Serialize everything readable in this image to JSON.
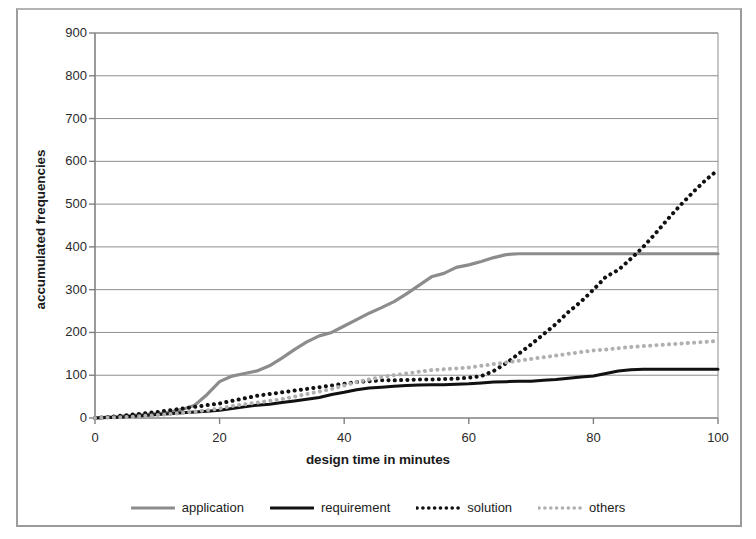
{
  "chart_data": {
    "type": "line",
    "title": "",
    "xlabel": "design time in minutes",
    "ylabel": "accumulated frequencies",
    "xlim": [
      0,
      100
    ],
    "ylim": [
      0,
      900
    ],
    "xticks": [
      0,
      20,
      40,
      60,
      80,
      100
    ],
    "yticks": [
      0,
      100,
      200,
      300,
      400,
      500,
      600,
      700,
      800,
      900
    ],
    "grid": "horizontal",
    "legend_position": "bottom",
    "x": [
      0,
      2,
      4,
      6,
      8,
      10,
      12,
      14,
      16,
      18,
      20,
      22,
      24,
      26,
      28,
      30,
      32,
      34,
      36,
      38,
      40,
      42,
      44,
      46,
      48,
      50,
      52,
      54,
      56,
      58,
      60,
      62,
      64,
      66,
      68,
      70,
      72,
      74,
      76,
      78,
      80,
      82,
      84,
      86,
      88,
      90,
      92,
      94,
      96,
      98,
      100
    ],
    "series": [
      {
        "name": "application",
        "style": "solid",
        "color": "#8c8c8c",
        "width": 3.2,
        "values": [
          0,
          2,
          4,
          6,
          8,
          10,
          14,
          20,
          30,
          55,
          85,
          98,
          104,
          110,
          122,
          140,
          160,
          178,
          192,
          200,
          215,
          230,
          245,
          258,
          272,
          290,
          310,
          330,
          338,
          352,
          358,
          366,
          375,
          382,
          384,
          384,
          384,
          384,
          384,
          384,
          384,
          384,
          384,
          384,
          384,
          384,
          384,
          384,
          384,
          384,
          384
        ]
      },
      {
        "name": "requirement",
        "style": "solid",
        "color": "#111111",
        "width": 3.0,
        "values": [
          0,
          1,
          2,
          4,
          6,
          8,
          10,
          12,
          14,
          16,
          18,
          22,
          26,
          30,
          32,
          36,
          40,
          44,
          48,
          55,
          60,
          66,
          70,
          72,
          74,
          76,
          77,
          78,
          78,
          79,
          80,
          82,
          84,
          85,
          86,
          86,
          88,
          90,
          93,
          96,
          98,
          104,
          110,
          113,
          114,
          114,
          114,
          114,
          114,
          114,
          114
        ]
      },
      {
        "name": "solution",
        "style": "dotted",
        "color": "#111111",
        "width": 4.0,
        "values": [
          0,
          2,
          5,
          8,
          11,
          14,
          18,
          22,
          26,
          30,
          34,
          40,
          46,
          52,
          56,
          60,
          64,
          68,
          72,
          76,
          80,
          84,
          86,
          88,
          88,
          89,
          90,
          90,
          91,
          92,
          94,
          98,
          110,
          128,
          150,
          172,
          196,
          220,
          248,
          272,
          300,
          330,
          346,
          372,
          400,
          432,
          466,
          498,
          528,
          556,
          580
        ]
      },
      {
        "name": "others",
        "style": "dotted",
        "color": "#b0b0b0",
        "width": 4.0,
        "values": [
          0,
          1,
          2,
          3,
          5,
          7,
          9,
          12,
          15,
          18,
          22,
          28,
          32,
          36,
          40,
          44,
          50,
          56,
          62,
          68,
          76,
          84,
          90,
          96,
          100,
          104,
          108,
          112,
          114,
          116,
          118,
          122,
          126,
          130,
          134,
          138,
          142,
          146,
          150,
          154,
          158,
          160,
          163,
          166,
          168,
          170,
          172,
          174,
          176,
          178,
          180
        ]
      }
    ]
  },
  "axes": {
    "y_tick_labels": [
      "900",
      "800",
      "700",
      "600",
      "500",
      "400",
      "300",
      "200",
      "100",
      "0"
    ],
    "x_tick_labels": [
      "0",
      "20",
      "40",
      "60",
      "80",
      "100"
    ],
    "x_title": "design time in minutes",
    "y_title": "accumulated frequencies"
  },
  "legend": {
    "items": [
      {
        "label": "application",
        "style": "solid",
        "color": "#8c8c8c"
      },
      {
        "label": "requirement",
        "style": "solid",
        "color": "#111111"
      },
      {
        "label": "solution",
        "style": "dotted",
        "color": "#111111"
      },
      {
        "label": "others",
        "style": "dotted",
        "color": "#b0b0b0"
      }
    ]
  },
  "colors": {
    "plot_border": "#808080",
    "gridline": "#8e8e8e",
    "frame": "#9a9a9a",
    "background": "#ffffff",
    "text": "#1b1b1b"
  }
}
